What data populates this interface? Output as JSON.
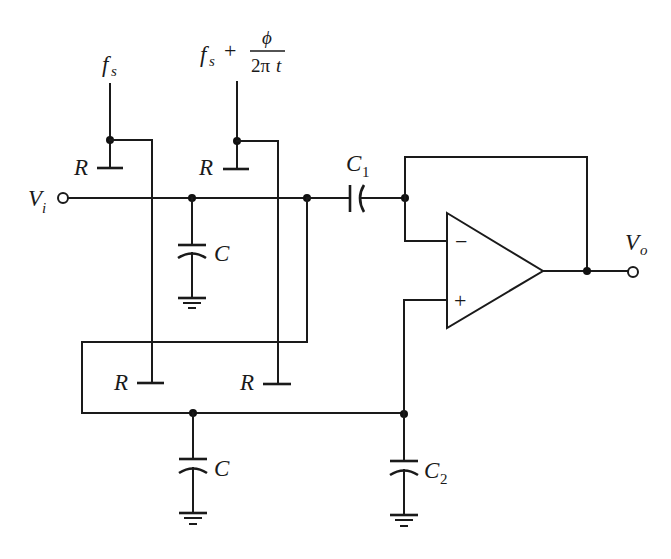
{
  "diagram": {
    "type": "circuit-schematic"
  },
  "labels": {
    "vin": {
      "main": "V",
      "sub": "i"
    },
    "vout": {
      "main": "V",
      "sub": "o"
    },
    "clock1": {
      "main": "f",
      "sub": "s"
    },
    "clock2": {
      "main": "f",
      "sub": "s",
      "plus": "+",
      "num": "ϕ",
      "den_a": "2π",
      "den_b": "t"
    },
    "r_top_left": "R",
    "r_top_right": "R",
    "r_bottom_left": "R",
    "r_bottom_right": "R",
    "c_top": "C",
    "c_bottom": "C",
    "c1": {
      "main": "C",
      "sub": "1"
    },
    "c2": {
      "main": "C",
      "sub": "2"
    },
    "opamp_minus": "−",
    "opamp_plus": "+"
  },
  "colors": {
    "ink": "#1a1a1a",
    "background": "#ffffff"
  }
}
